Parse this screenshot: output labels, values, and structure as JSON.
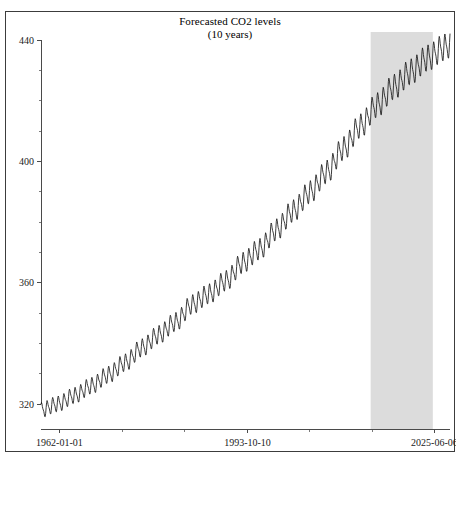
{
  "top_fragment": "",
  "chart_data": {
    "type": "line",
    "title": "Forecasted CO2 levels",
    "subtitle": "(10 years)",
    "xlabel": "",
    "ylabel": "",
    "grid": false,
    "legend": null,
    "ylim": [
      312,
      443
    ],
    "yticks": [
      320,
      360,
      400,
      440
    ],
    "ytick_labels": [
      "320",
      "360",
      "400",
      "440"
    ],
    "y_minor_tick_count_between": 3,
    "xticks": [
      "1962-01-01",
      "1993-10-10",
      "2025-06-06"
    ],
    "xtick_labels": [
      "1962-01-01",
      "1993-10-10",
      "2025-06-06"
    ],
    "x_minor_tick_count_between": 2,
    "colors": {
      "line": "#1a1a1a",
      "forecast_band": "#dcdcdc",
      "axis": "#4a4a4a",
      "frame": "#3c3c3c"
    },
    "annotations": [
      {
        "name": "forecast-region",
        "kind": "vspan",
        "label": "10 year forecast",
        "x_start_fraction": 0.806,
        "x_end_fraction": 0.958,
        "color": "#dcdcdc"
      }
    ],
    "series": [
      {
        "name": "CO2 concentration (ppm)",
        "description": "Monthly mean atmospheric CO2 with seasonal oscillation; rising secular trend; final segment is forecast.",
        "x_start": "1962-01-01",
        "x_end": "2035-06-06",
        "sampling": "monthly",
        "seasonal_amplitude_start": 2.6,
        "seasonal_amplitude_end": 4.6,
        "trend_annual_values": [
          {
            "year": 1962,
            "value": 318.0
          },
          {
            "year": 1965,
            "value": 320.0
          },
          {
            "year": 1968,
            "value": 322.8
          },
          {
            "year": 1971,
            "value": 326.0
          },
          {
            "year": 1974,
            "value": 329.6
          },
          {
            "year": 1977,
            "value": 333.6
          },
          {
            "year": 1980,
            "value": 338.5
          },
          {
            "year": 1983,
            "value": 342.8
          },
          {
            "year": 1986,
            "value": 347.0
          },
          {
            "year": 1989,
            "value": 352.8
          },
          {
            "year": 1992,
            "value": 356.3
          },
          {
            "year": 1995,
            "value": 360.6
          },
          {
            "year": 1998,
            "value": 366.5
          },
          {
            "year": 2001,
            "value": 371.0
          },
          {
            "year": 2004,
            "value": 377.4
          },
          {
            "year": 2007,
            "value": 383.6
          },
          {
            "year": 2010,
            "value": 389.8
          },
          {
            "year": 2013,
            "value": 396.5
          },
          {
            "year": 2016,
            "value": 404.2
          },
          {
            "year": 2019,
            "value": 411.6
          },
          {
            "year": 2022,
            "value": 418.5
          },
          {
            "year": 2025,
            "value": 424.5
          },
          {
            "year": 2028,
            "value": 429.5
          },
          {
            "year": 2031,
            "value": 434.0
          },
          {
            "year": 2034,
            "value": 437.5
          },
          {
            "year": 2035,
            "value": 438.5
          }
        ],
        "y_min_observed": 314.5,
        "y_max_observed": 440.5
      }
    ]
  }
}
